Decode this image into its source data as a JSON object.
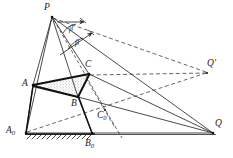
{
  "figure": {
    "type": "geometry-diagram",
    "title": "",
    "colors": {
      "stroke": "#2b2b2b",
      "thick_stroke": "#111111",
      "ground": "#555555",
      "fill_stipple": "#4a4a4a",
      "background": "#ffffff"
    },
    "points": [
      {
        "id": "P",
        "label": "P",
        "x": 52,
        "y": 16,
        "label_x": 44,
        "label_y": 3
      },
      {
        "id": "A",
        "label": "A",
        "x": 33,
        "y": 85,
        "label_x": 22,
        "label_y": 80
      },
      {
        "id": "A0",
        "label": "A",
        "sub": "0",
        "x": 26,
        "y": 133,
        "label_x": 7,
        "label_y": 127
      },
      {
        "id": "B",
        "label": "B",
        "x": 78,
        "y": 97,
        "label_x": 72,
        "label_y": 100
      },
      {
        "id": "B0",
        "label": "B",
        "sub": "0",
        "x": 92,
        "y": 133,
        "label_x": 86,
        "label_y": 140
      },
      {
        "id": "C",
        "label": "C",
        "x": 89,
        "y": 74,
        "label_x": 86,
        "label_y": 61
      },
      {
        "id": "C0",
        "label": "C",
        "sub": "0",
        "x": 105,
        "y": 110,
        "label_x": 98,
        "label_y": 112
      },
      {
        "id": "Q",
        "label": "Q",
        "x": 213,
        "y": 133,
        "label_x": 215,
        "label_y": 120
      },
      {
        "id": "Qp",
        "label": "Q",
        "prime": "′",
        "x": 207,
        "y": 73,
        "label_x": 208,
        "label_y": 60
      }
    ],
    "angles": [
      {
        "id": "beta-upper",
        "label": "β",
        "label_x": 69,
        "label_y": 29
      },
      {
        "id": "beta-lower",
        "label": "β",
        "label_x": 75,
        "label_y": 43
      }
    ],
    "solid_segments": [
      {
        "name": "P-A0",
        "from": "P",
        "to": "A0"
      },
      {
        "name": "P-A",
        "from": "P",
        "to": "A"
      },
      {
        "name": "P-B",
        "from": "P",
        "to": "B"
      },
      {
        "name": "P-C",
        "from": "P",
        "to": "C"
      },
      {
        "name": "P-Q",
        "from": "P",
        "to": "Q"
      },
      {
        "name": "A-C",
        "from": "A",
        "to": "C"
      },
      {
        "name": "A-B",
        "from": "A",
        "to": "B"
      },
      {
        "name": "B-C",
        "from": "B",
        "to": "C"
      },
      {
        "name": "A0-B0",
        "from": "A0",
        "to": "B0"
      },
      {
        "name": "B0-Q",
        "from": "B0",
        "to": "Q"
      },
      {
        "name": "A-A0",
        "from": "A",
        "to": "A0"
      },
      {
        "name": "B-B0",
        "from": "B",
        "to": "B0"
      },
      {
        "name": "A-Q",
        "from": "A",
        "to": "Q"
      },
      {
        "name": "C-Q",
        "from": "C",
        "to": "Q"
      }
    ],
    "dashed_segments": [
      {
        "name": "P-Qp",
        "from": "P",
        "to": "Qp"
      },
      {
        "name": "A0-Qp",
        "from": "A0",
        "to": "Qp"
      },
      {
        "name": "C-Qp",
        "from": "C",
        "to": "Qp"
      },
      {
        "name": "P-C0",
        "from": "P",
        "to": "C0"
      },
      {
        "name": "C0-tail",
        "from": "C0",
        "to": "tail"
      }
    ],
    "ground": {
      "name": "ground-line",
      "hatched_from_x": 26,
      "hatched_to_x": 95,
      "y": 134,
      "extends_to_x": 216
    },
    "shaded_region": {
      "name": "triangle-ABC",
      "vertices": [
        "A",
        "C",
        "B"
      ],
      "pattern": "stipple"
    },
    "arrow_rays": [
      {
        "name": "ray-upper-arrow"
      },
      {
        "name": "ray-lower-arrow"
      }
    ]
  }
}
